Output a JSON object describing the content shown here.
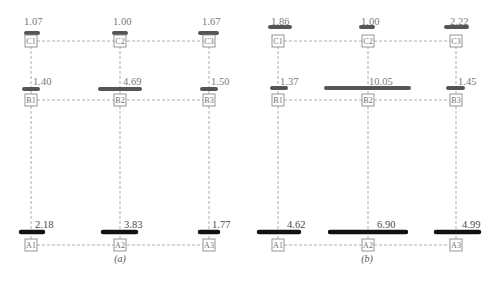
{
  "chart_data": [
    {
      "type": "diagram",
      "panel": "(a)",
      "caption": "(a)",
      "columns": [
        31,
        120,
        209
      ],
      "rows": {
        "C": 41,
        "B": 100,
        "A": 245
      },
      "nodes": [
        "C1",
        "C2",
        "C3",
        "B1",
        "B2",
        "B3",
        "A1",
        "A2",
        "A3"
      ],
      "bars": [
        {
          "node": "C1",
          "value": "1.07",
          "x1": 26,
          "x2": 38,
          "y": 33,
          "color": "#555555",
          "label_x": 24,
          "label_y": 25
        },
        {
          "node": "C2",
          "value": "1.00",
          "x1": 114,
          "x2": 126,
          "y": 33,
          "color": "#555555",
          "label_x": 113,
          "label_y": 25
        },
        {
          "node": "C3",
          "value": "1.67",
          "x1": 200,
          "x2": 217,
          "y": 33,
          "color": "#555555",
          "label_x": 202,
          "label_y": 25
        },
        {
          "node": "B1",
          "value": "1.40",
          "x1": 24,
          "x2": 38,
          "y": 89,
          "color": "#555555",
          "label_x": 33,
          "label_y": 85
        },
        {
          "node": "B2",
          "value": "4.69",
          "x1": 100,
          "x2": 140,
          "y": 89,
          "color": "#555555",
          "label_x": 123,
          "label_y": 85
        },
        {
          "node": "B3",
          "value": "1.50",
          "x1": 202,
          "x2": 216,
          "y": 89,
          "color": "#555555",
          "label_x": 211,
          "label_y": 85
        },
        {
          "node": "A1",
          "value": "2.18",
          "x1": 21,
          "x2": 43,
          "y": 232,
          "color": "#111111",
          "label_x": 35,
          "label_y": 228
        },
        {
          "node": "A2",
          "value": "3.83",
          "x1": 103,
          "x2": 136,
          "y": 232,
          "color": "#111111",
          "label_x": 124,
          "label_y": 228
        },
        {
          "node": "A3",
          "value": "1.77",
          "x1": 200,
          "x2": 218,
          "y": 232,
          "color": "#111111",
          "label_x": 212,
          "label_y": 228
        }
      ]
    },
    {
      "type": "diagram",
      "panel": "(b)",
      "caption": "(b)",
      "columns": [
        278,
        368,
        456
      ],
      "rows": {
        "C": 41,
        "B": 100,
        "A": 245
      },
      "nodes": [
        "C1",
        "C2",
        "C3",
        "B1",
        "B2",
        "B3",
        "A1",
        "A2",
        "A3"
      ],
      "bars": [
        {
          "node": "C1",
          "value": "1.86",
          "x1": 270,
          "x2": 290,
          "y": 27,
          "color": "#555555",
          "label_x": 271,
          "label_y": 25
        },
        {
          "node": "C2",
          "value": "1.00",
          "x1": 361,
          "x2": 373,
          "y": 27,
          "color": "#555555",
          "label_x": 361,
          "label_y": 25
        },
        {
          "node": "C3",
          "value": "2.22",
          "x1": 446,
          "x2": 467,
          "y": 27,
          "color": "#555555",
          "label_x": 450,
          "label_y": 25
        },
        {
          "node": "B1",
          "value": "1.37",
          "x1": 272,
          "x2": 286,
          "y": 88,
          "color": "#555555",
          "label_x": 280,
          "label_y": 85
        },
        {
          "node": "B2",
          "value": "10.05",
          "x1": 326,
          "x2": 409,
          "y": 88,
          "color": "#555555",
          "label_x": 369,
          "label_y": 85
        },
        {
          "node": "B3",
          "value": "1.45",
          "x1": 448,
          "x2": 463,
          "y": 88,
          "color": "#555555",
          "label_x": 458,
          "label_y": 85
        },
        {
          "node": "A1",
          "value": "4.62",
          "x1": 259,
          "x2": 299,
          "y": 232,
          "color": "#111111",
          "label_x": 287,
          "label_y": 228
        },
        {
          "node": "A2",
          "value": "6.90",
          "x1": 330,
          "x2": 406,
          "y": 232,
          "color": "#111111",
          "label_x": 377,
          "label_y": 228
        },
        {
          "node": "A3",
          "value": "4.99",
          "x1": 436,
          "x2": 479,
          "y": 232,
          "color": "#111111",
          "label_x": 462,
          "label_y": 228
        }
      ]
    }
  ]
}
